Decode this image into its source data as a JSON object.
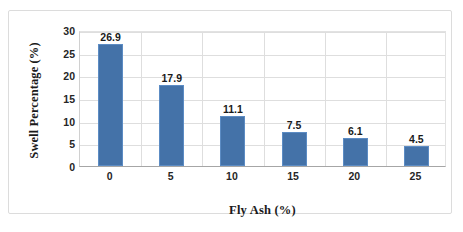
{
  "chart_data": {
    "type": "bar",
    "title": "",
    "categories": [
      "0",
      "5",
      "10",
      "15",
      "20",
      "25"
    ],
    "values": [
      26.9,
      17.9,
      11.1,
      7.5,
      6.1,
      4.5
    ],
    "data_labels": [
      "26.9",
      "17.9",
      "11.1",
      "7.5",
      "6.1",
      "4.5"
    ],
    "xlabel": "Fly Ash (%)",
    "ylabel": "Swell Percentage (%)",
    "ylim": [
      0,
      30
    ],
    "ytick_step": 5,
    "ytick_labels": [
      "0",
      "5",
      "10",
      "15",
      "20",
      "25",
      "30"
    ],
    "grid": {
      "horizontal": true,
      "vertical": true
    },
    "legend": {
      "visible": false,
      "position": "none"
    },
    "series": [
      {
        "name": "Swell Percentage",
        "values": [
          26.9,
          17.9,
          11.1,
          7.5,
          6.1,
          4.5
        ]
      }
    ],
    "colors": {
      "bar_fill": "#4472a8",
      "bar_border": "#5c8cc4",
      "gridline": "#dedede",
      "axis_line": "#a6a6a6",
      "frame": "#dcdcdc",
      "background": "#ffffff",
      "text": "#1a1a1a"
    }
  }
}
